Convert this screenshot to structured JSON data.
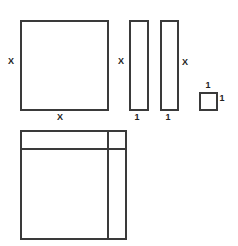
{
  "tiles": {
    "x_squared": {
      "side_label_left": "X",
      "side_label_bottom": "X"
    },
    "x_rod_1": {
      "side_label_left": "X",
      "side_label_bottom": "1"
    },
    "x_rod_2": {
      "side_label_right": "X",
      "side_label_bottom": "1"
    },
    "unit_square": {
      "side_label_top": "1",
      "side_label_right": "1"
    }
  },
  "composite": {
    "description": "x² tile with two x-rods arranged around it and a unit square in the corner"
  },
  "colors": {
    "stroke": "#3a3a3a",
    "background": "#ffffff"
  }
}
